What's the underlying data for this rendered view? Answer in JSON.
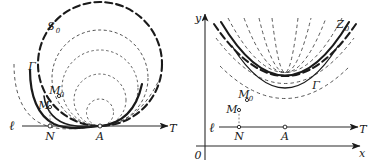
{
  "figure": {
    "title": "",
    "background_color": "#ffffff",
    "ink_color": "#1a1a1a",
    "panels": [
      {
        "id": "left",
        "name": "circles-tangent-panel",
        "description": "Family of circles tangent to line l at point A",
        "labels": {
          "envelope_curve": "S",
          "envelope_curve_sub": "0",
          "gamma_curve": "Γ",
          "point_m": "M",
          "point_m0": "M",
          "point_m0_sub": "0",
          "point_n": "N",
          "point_a": "A",
          "line_l": "ℓ",
          "axis_t": "T"
        }
      },
      {
        "id": "right",
        "name": "parabolas-panel",
        "description": "Family of parabolas with vertex at A on line l, drawn over xy axes",
        "labels": {
          "envelope_curve": "Z",
          "envelope_curve_sub": "0",
          "gamma_curve": "Γ",
          "point_m": "M",
          "point_m0": "M",
          "point_m0_sub": "0",
          "point_n": "N",
          "point_a": "A",
          "line_l": "ℓ",
          "axis_t": "T",
          "axis_y": "y",
          "axis_x": "x",
          "origin": "0"
        }
      }
    ],
    "colors": {
      "stroke": "#1a1a1a",
      "thin_stroke": "#3a3a3a",
      "axis": "#2b2b2b",
      "paper": "#ffffff"
    },
    "stroke_widths": {
      "bold": 2.1,
      "medium": 1.5,
      "thin": 0.8,
      "axis": 1.0
    },
    "dash_patterns": {
      "bold_dash": "7,4",
      "thin_dash": "3.5,3",
      "fine_dash": "2.5,2.5"
    }
  }
}
